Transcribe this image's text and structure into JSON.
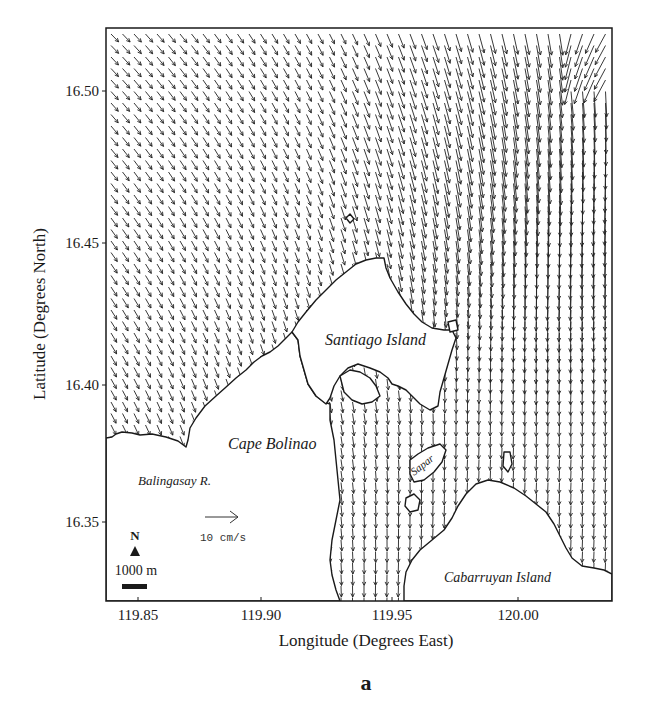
{
  "chart_data": {
    "type": "quiver",
    "title": "",
    "panel_label": "a",
    "xlabel": "Longitude (Degrees East)",
    "ylabel": "Latitude (Degrees North)",
    "xlim": [
      119.837,
      120.036
    ],
    "ylim": [
      16.325,
      16.522
    ],
    "xticks": [
      {
        "value": 119.85,
        "label": "119.85"
      },
      {
        "value": 119.9,
        "label": "119.90"
      },
      {
        "value": 119.95,
        "label": "119.95"
      },
      {
        "value": 120.0,
        "label": "120.00"
      }
    ],
    "yticks": [
      {
        "value": 16.5,
        "label": "16.50"
      },
      {
        "value": 16.45,
        "label": "16.45"
      },
      {
        "value": 16.4,
        "label": "16.40"
      },
      {
        "value": 16.35,
        "label": "16.35"
      }
    ],
    "grid": false,
    "reference_vector": {
      "label": "10 cm/s",
      "magnitude_cm_s": 10
    },
    "north_arrow": {
      "label": "N"
    },
    "scale_bar": {
      "label": "1000 m"
    },
    "place_labels": [
      {
        "name": "Santiago Island",
        "lon": 119.955,
        "lat": 16.418
      },
      {
        "name": "Cape Bolinao",
        "lon": 119.905,
        "lat": 16.383
      },
      {
        "name": "Balingasay R.",
        "lon": 119.865,
        "lat": 16.366
      },
      {
        "name": "Cabarruyan Island",
        "lon": 119.99,
        "lat": 16.34
      },
      {
        "name": "Sapar",
        "lon": 119.962,
        "lat": 16.373
      }
    ],
    "flow_description": {
      "general_direction": "southeast in western offshore region, turning south near coast",
      "strong_flow_region": "northeast (around 120.00-120.03E, 16.43-16.51N) with largest vectors",
      "channel_flow": "southward through channels between Santiago Island and Cabarruyan Island"
    }
  },
  "figure": {
    "xlabel": "Longitude (Degrees East)",
    "ylabel": "Latitude (Degrees North)",
    "panel_label": "a",
    "ref_vector_label": "10 cm/s",
    "north_label": "N",
    "scale_label": "1000 m",
    "labels": {
      "santiago": "Santiago Island",
      "bolinao": "Cape Bolinao",
      "balingasay": "Balingasay R.",
      "cabarruyan": "Cabarruyan Island",
      "sapar": "Sapar"
    },
    "ticks": {
      "x0": "119.85",
      "x1": "119.90",
      "x2": "119.95",
      "x3": "120.00",
      "y0": "16.50",
      "y1": "16.45",
      "y2": "16.40",
      "y3": "16.35"
    }
  }
}
